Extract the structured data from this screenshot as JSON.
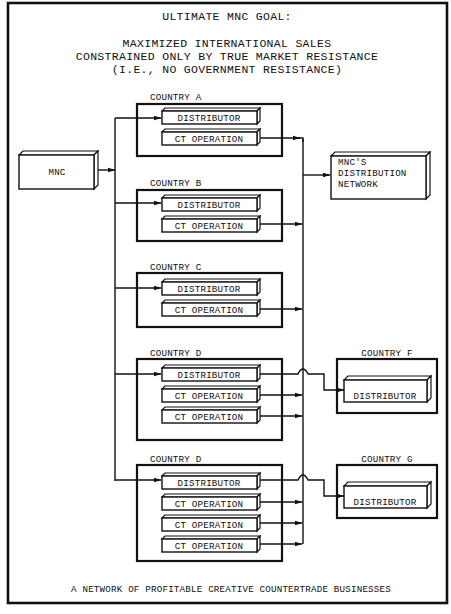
{
  "header": {
    "title": "ULTIMATE MNC GOAL:",
    "goal_lines": [
      "MAXIMIZED INTERNATIONAL SALES",
      "CONSTRAINED ONLY BY TRUE MARKET RESISTANCE",
      "(I.E., NO GOVERNMENT RESISTANCE)"
    ]
  },
  "source": {
    "label": "MNC"
  },
  "destination": {
    "lines": [
      "MNC'S",
      "DISTRIBUTION",
      "NETWORK"
    ]
  },
  "countries": [
    {
      "name": "COUNTRY A",
      "units": [
        "DISTRIBUTOR",
        "CT OPERATION"
      ]
    },
    {
      "name": "COUNTRY B",
      "units": [
        "DISTRIBUTOR",
        "CT OPERATION"
      ]
    },
    {
      "name": "COUNTRY C",
      "units": [
        "DISTRIBUTOR",
        "CT OPERATION"
      ]
    },
    {
      "name": "COUNTRY D",
      "units": [
        "DISTRIBUTOR",
        "CT OPERATION",
        "CT OPERATION"
      ]
    },
    {
      "name": "COUNTRY D",
      "units": [
        "DISTRIBUTOR",
        "CT OPERATION",
        "CT OPERATION",
        "CT OPERATION"
      ]
    }
  ],
  "external_countries": [
    {
      "name": "COUNTRY F",
      "units": [
        "DISTRIBUTOR"
      ],
      "fed_by": "COUNTRY D (first) DISTRIBUTOR"
    },
    {
      "name": "COUNTRY G",
      "units": [
        "DISTRIBUTOR"
      ],
      "fed_by": "COUNTRY D (second) DISTRIBUTOR"
    }
  ],
  "footer": {
    "caption": "A NETWORK OF PROFITABLE CREATIVE COUNTERTRADE BUSINESSES"
  }
}
